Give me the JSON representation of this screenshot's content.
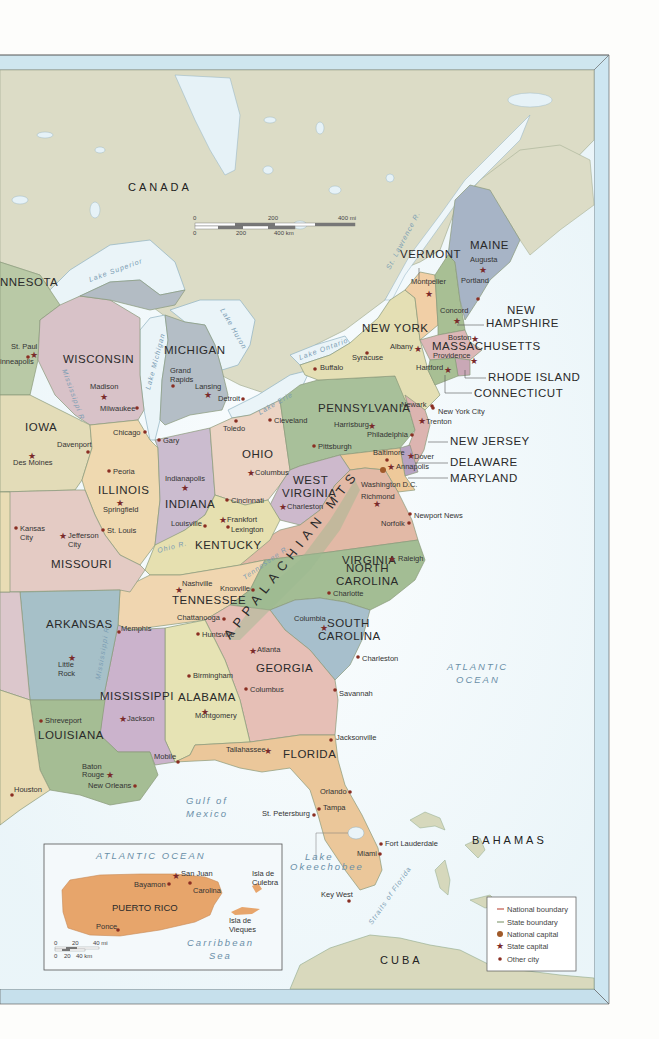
{
  "map": {
    "title": "Eastern United States",
    "colors": {
      "ocean": "#e8f4f8",
      "canada_land": "#dcdcc8",
      "frame_blue": "#cfe6ef",
      "national_boundary": "#c0584a",
      "state_boundary": "#8aa07a",
      "state_capital": "#7a2a2a",
      "other_city": "#8a2e22",
      "national_capital": "#a05a2a"
    },
    "countries": [
      {
        "name": "CANADA",
        "x": 128,
        "y": 191
      },
      {
        "name": "BAHAMAS",
        "x": 472,
        "y": 844
      },
      {
        "name": "CUBA",
        "x": 380,
        "y": 964
      }
    ],
    "water_labels": [
      {
        "name": "ATLANTIC",
        "x": 447,
        "y": 670
      },
      {
        "name": "OCEAN",
        "x": 456,
        "y": 683
      },
      {
        "name": "Gulf of",
        "x": 186,
        "y": 804
      },
      {
        "name": "Mexico",
        "x": 186,
        "y": 817
      },
      {
        "name": "Lake",
        "x": 305,
        "y": 860
      },
      {
        "name": "Okeechobee",
        "x": 290,
        "y": 870
      }
    ],
    "lake_labels": [
      {
        "name": "Lake Superior",
        "x": 90,
        "y": 282,
        "rot": -20
      },
      {
        "name": "Lake Michigan",
        "x": 150,
        "y": 390,
        "rot": -75
      },
      {
        "name": "Lake Huron",
        "x": 220,
        "y": 310,
        "rot": 60
      },
      {
        "name": "Lake Ontario",
        "x": 300,
        "y": 360,
        "rot": -20
      },
      {
        "name": "Lake Erie",
        "x": 260,
        "y": 415,
        "rot": -30
      }
    ],
    "river_labels": [
      {
        "name": "St. Lawrence R.",
        "x": 390,
        "y": 270,
        "rot": -62
      },
      {
        "name": "Mississippi R.",
        "x": 62,
        "y": 370,
        "rot": 70
      },
      {
        "name": "Mississippi R.",
        "x": 100,
        "y": 680,
        "rot": -80
      },
      {
        "name": "Ohio R.",
        "x": 158,
        "y": 553,
        "rot": -15
      },
      {
        "name": "Tennessee R.",
        "x": 245,
        "y": 580,
        "rot": -35
      },
      {
        "name": "Straits of Florida",
        "x": 372,
        "y": 925,
        "rot": -55
      }
    ],
    "mountains": {
      "name": "APPALACHIAN MTS",
      "x": 230,
      "y": 640,
      "rot": -52
    },
    "states": [
      {
        "name": "NNESOTA",
        "x": 0,
        "y": 286
      },
      {
        "name": "WISCONSIN",
        "x": 63,
        "y": 363
      },
      {
        "name": "MICHIGAN",
        "x": 164,
        "y": 354
      },
      {
        "name": "IOWA",
        "x": 25,
        "y": 431
      },
      {
        "name": "ILLINOIS",
        "x": 98,
        "y": 494
      },
      {
        "name": "INDIANA",
        "x": 165,
        "y": 508
      },
      {
        "name": "OHIO",
        "x": 242,
        "y": 458
      },
      {
        "name": "PENNSYLVANIA",
        "x": 318,
        "y": 412
      },
      {
        "name": "NEW YORK",
        "x": 362,
        "y": 332
      },
      {
        "name": "VERMONT",
        "x": 400,
        "y": 258
      },
      {
        "name": "MAINE",
        "x": 470,
        "y": 249
      },
      {
        "name": "MASSACHUSETTS",
        "x": 432,
        "y": 350
      },
      {
        "name": "WEST",
        "x": 293,
        "y": 484
      },
      {
        "name": "VIRGINIA",
        "x": 282,
        "y": 497
      },
      {
        "name": "KENTUCKY",
        "x": 195,
        "y": 549
      },
      {
        "name": "MISSOURI",
        "x": 51,
        "y": 568
      },
      {
        "name": "VIRGINIA",
        "x": 342,
        "y": 564
      },
      {
        "name": "NORTH",
        "x": 346,
        "y": 572
      },
      {
        "name": "CAROLINA",
        "x": 336,
        "y": 585
      },
      {
        "name": "TENNESSEE",
        "x": 172,
        "y": 604
      },
      {
        "name": "ARKANSAS",
        "x": 46,
        "y": 628
      },
      {
        "name": "SOUTH",
        "x": 327,
        "y": 627
      },
      {
        "name": "CAROLINA",
        "x": 318,
        "y": 640
      },
      {
        "name": "GEORGIA",
        "x": 256,
        "y": 672
      },
      {
        "name": "MISSISSIPPI",
        "x": 100,
        "y": 700
      },
      {
        "name": "ALABAMA",
        "x": 178,
        "y": 701
      },
      {
        "name": "LOUISIANA",
        "x": 38,
        "y": 739
      },
      {
        "name": "FLORIDA",
        "x": 283,
        "y": 758
      },
      {
        "name": "PUERTO RICO",
        "x": 112,
        "y": 911
      }
    ],
    "callout_states": [
      {
        "name": "NEW",
        "x": 507,
        "y": 314
      },
      {
        "name": "HAMPSHIRE",
        "x": 486,
        "y": 327
      },
      {
        "name": "RHODE ISLAND",
        "x": 488,
        "y": 381
      },
      {
        "name": "CONNECTICUT",
        "x": 474,
        "y": 397
      },
      {
        "name": "NEW JERSEY",
        "x": 450,
        "y": 445
      },
      {
        "name": "DELAWARE",
        "x": 450,
        "y": 466
      },
      {
        "name": "MARYLAND",
        "x": 450,
        "y": 482
      }
    ],
    "cities": [
      {
        "name": "Augusta",
        "x": 470,
        "y": 262,
        "type": "state_capital",
        "mx": 483,
        "my": 269
      },
      {
        "name": "Portland",
        "x": 461,
        "y": 283,
        "type": "city",
        "mx": 478,
        "my": 299,
        "lx": 461,
        "ly": 285
      },
      {
        "name": "Montpelier",
        "x": 411,
        "y": 284,
        "type": "state_capital",
        "mx": 429,
        "my": 293
      },
      {
        "name": "Concord",
        "x": 440,
        "y": 313,
        "type": "state_capital",
        "mx": 457,
        "my": 320
      },
      {
        "name": "Boston",
        "x": 448,
        "y": 340,
        "type": "state_capital",
        "mx": 475,
        "my": 338
      },
      {
        "name": "Providence",
        "x": 433,
        "y": 358,
        "type": "state_capital",
        "mx": 474,
        "my": 360
      },
      {
        "name": "Hartford",
        "x": 416,
        "y": 370,
        "type": "state_capital",
        "mx": 448,
        "my": 369
      },
      {
        "name": "Albany",
        "x": 390,
        "y": 349,
        "type": "state_capital",
        "mx": 418,
        "my": 348
      },
      {
        "name": "Syracuse",
        "x": 352,
        "y": 360,
        "type": "city",
        "mx": 367,
        "my": 353
      },
      {
        "name": "Buffalo",
        "x": 320,
        "y": 370,
        "type": "city",
        "mx": 315,
        "my": 369
      },
      {
        "name": "Newark",
        "x": 401,
        "y": 407,
        "type": "city",
        "mx": 432,
        "my": 406
      },
      {
        "name": "New York City",
        "x": 438,
        "y": 414,
        "type": "city",
        "mx": 433,
        "my": 408
      },
      {
        "name": "Trenton",
        "x": 426,
        "y": 424,
        "type": "state_capital",
        "mx": 422,
        "my": 420
      },
      {
        "name": "Harrisburg",
        "x": 334,
        "y": 427,
        "type": "state_capital",
        "mx": 372,
        "my": 425
      },
      {
        "name": "Philadelphia",
        "x": 367,
        "y": 437,
        "type": "city",
        "mx": 412,
        "my": 435
      },
      {
        "name": "Pittsburgh",
        "x": 318,
        "y": 449,
        "type": "city",
        "mx": 314,
        "my": 446
      },
      {
        "name": "Baltimore",
        "x": 373,
        "y": 455,
        "type": "city",
        "mx": 387,
        "my": 460
      },
      {
        "name": "Dover",
        "x": 414,
        "y": 459,
        "type": "state_capital",
        "mx": 411,
        "my": 455
      },
      {
        "name": "Annapolis",
        "x": 396,
        "y": 469,
        "type": "state_capital",
        "mx": 391,
        "my": 466
      },
      {
        "name": "Washington D.C.",
        "x": 361,
        "y": 487,
        "type": "national_capital",
        "mx": 383,
        "my": 470
      },
      {
        "name": "Richmond",
        "x": 361,
        "y": 499,
        "type": "state_capital",
        "mx": 377,
        "my": 503
      },
      {
        "name": "Newport News",
        "x": 414,
        "y": 518,
        "type": "city",
        "mx": 410,
        "my": 514
      },
      {
        "name": "Norfolk",
        "x": 381,
        "y": 526,
        "type": "city",
        "mx": 409,
        "my": 523
      },
      {
        "name": "Raleigh",
        "x": 398,
        "y": 561,
        "type": "state_capital",
        "mx": 392,
        "my": 558
      },
      {
        "name": "Charlotte",
        "x": 333,
        "y": 596,
        "type": "city",
        "mx": 329,
        "my": 593
      },
      {
        "name": "Columbia",
        "x": 294,
        "y": 621,
        "type": "state_capital",
        "mx": 324,
        "my": 627
      },
      {
        "name": "Charleston",
        "x": 362,
        "y": 661,
        "type": "city",
        "mx": 358,
        "my": 657
      },
      {
        "name": "Savannah",
        "x": 339,
        "y": 696,
        "type": "city",
        "mx": 335,
        "my": 690
      },
      {
        "name": "Cleveland",
        "x": 274,
        "y": 423,
        "type": "city",
        "mx": 270,
        "my": 420
      },
      {
        "name": "Toledo",
        "x": 223,
        "y": 431,
        "type": "city",
        "mx": 236,
        "my": 421
      },
      {
        "name": "Detroit",
        "x": 218,
        "y": 401,
        "type": "city",
        "mx": 243,
        "my": 399
      },
      {
        "name": "Lansing",
        "x": 195,
        "y": 389,
        "type": "state_capital",
        "mx": 208,
        "my": 394
      },
      {
        "name": "Grand",
        "x": 170,
        "y": 373,
        "type": "none"
      },
      {
        "name": "Rapids",
        "x": 170,
        "y": 382,
        "type": "city",
        "mx": 173,
        "my": 386
      },
      {
        "name": "Columbus",
        "x": 255,
        "y": 475,
        "type": "state_capital",
        "mx": 251,
        "my": 472
      },
      {
        "name": "Cincinnati",
        "x": 231,
        "y": 503,
        "type": "city",
        "mx": 227,
        "my": 500
      },
      {
        "name": "Charleston",
        "x": 287,
        "y": 509,
        "type": "state_capital",
        "mx": 283,
        "my": 506
      },
      {
        "name": "Frankfort",
        "x": 227,
        "y": 522,
        "type": "state_capital",
        "mx": 223,
        "my": 519
      },
      {
        "name": "Lexington",
        "x": 231,
        "y": 532,
        "type": "city",
        "mx": 228,
        "my": 527
      },
      {
        "name": "Louisville",
        "x": 171,
        "y": 526,
        "type": "city",
        "mx": 205,
        "my": 526
      },
      {
        "name": "Indianapolis",
        "x": 165,
        "y": 481,
        "type": "none"
      },
      {
        "name": "",
        "x": 0,
        "y": 0,
        "type": "state_capital",
        "mx": 185,
        "my": 487
      },
      {
        "name": "Gary",
        "x": 163,
        "y": 443,
        "type": "city",
        "mx": 159,
        "my": 440
      },
      {
        "name": "Chicago",
        "x": 113,
        "y": 435,
        "type": "city",
        "mx": 145,
        "my": 432
      },
      {
        "name": "Peoria",
        "x": 113,
        "y": 474,
        "type": "city",
        "mx": 109,
        "my": 471
      },
      {
        "name": "Springfield",
        "x": 103,
        "y": 512,
        "type": "state_capital",
        "mx": 120,
        "my": 502
      },
      {
        "name": "St. Louis",
        "x": 107,
        "y": 533,
        "type": "city",
        "mx": 103,
        "my": 530
      },
      {
        "name": "Milwaukee",
        "x": 100,
        "y": 411,
        "type": "city",
        "mx": 137,
        "my": 408
      },
      {
        "name": "Madison",
        "x": 90,
        "y": 389,
        "type": "none"
      },
      {
        "name": "",
        "x": 0,
        "y": 0,
        "type": "state_capital",
        "mx": 104,
        "my": 396
      },
      {
        "name": "St. Paul",
        "x": 11,
        "y": 349,
        "type": "none"
      },
      {
        "name": "",
        "x": 0,
        "y": 0,
        "type": "state_capital",
        "mx": 34,
        "my": 354
      },
      {
        "name": "inneapolis",
        "x": 0,
        "y": 364,
        "type": "city",
        "mx": 28,
        "my": 357
      },
      {
        "name": "Davenport",
        "x": 57,
        "y": 447,
        "type": "city",
        "mx": 88,
        "my": 452
      },
      {
        "name": "Des Moines",
        "x": 13,
        "y": 465,
        "type": "none"
      },
      {
        "name": "",
        "x": 0,
        "y": 0,
        "type": "state_capital",
        "mx": 32,
        "my": 455
      },
      {
        "name": "Kansas",
        "x": 20,
        "y": 531,
        "type": "city",
        "mx": 16,
        "my": 528
      },
      {
        "name": "City",
        "x": 20,
        "y": 540,
        "type": "none"
      },
      {
        "name": "Jefferson",
        "x": 68,
        "y": 538,
        "type": "state_capital",
        "mx": 63,
        "my": 535
      },
      {
        "name": "City",
        "x": 68,
        "y": 547,
        "type": "none"
      },
      {
        "name": "Nashville",
        "x": 182,
        "y": 586,
        "type": "state_capital",
        "mx": 179,
        "my": 589
      },
      {
        "name": "Knoxville",
        "x": 220,
        "y": 591,
        "type": "city",
        "mx": 253,
        "my": 590
      },
      {
        "name": "Chattanooga",
        "x": 177,
        "y": 620,
        "type": "city",
        "mx": 224,
        "my": 619
      },
      {
        "name": "Memphis",
        "x": 121,
        "y": 631,
        "type": "city",
        "mx": 119,
        "my": 632
      },
      {
        "name": "Huntsville",
        "x": 202,
        "y": 637,
        "type": "city",
        "mx": 198,
        "my": 634
      },
      {
        "name": "Atlanta",
        "x": 257,
        "y": 652,
        "type": "state_capital",
        "mx": 253,
        "my": 650
      },
      {
        "name": "Birmingham",
        "x": 193,
        "y": 678,
        "type": "city",
        "mx": 189,
        "my": 676
      },
      {
        "name": "Columbus",
        "x": 250,
        "y": 692,
        "type": "city",
        "mx": 246,
        "my": 689
      },
      {
        "name": "Montgomery",
        "x": 195,
        "y": 718,
        "type": "state_capital",
        "mx": 205,
        "my": 711
      },
      {
        "name": "Jackson",
        "x": 127,
        "y": 721,
        "type": "state_capital",
        "mx": 123,
        "my": 718
      },
      {
        "name": "Little",
        "x": 58,
        "y": 667,
        "type": "state_capital",
        "mx": 72,
        "my": 657
      },
      {
        "name": "Rock",
        "x": 58,
        "y": 676,
        "type": "none"
      },
      {
        "name": "Shreveport",
        "x": 45,
        "y": 723,
        "type": "city",
        "mx": 41,
        "my": 721
      },
      {
        "name": "Baton",
        "x": 82,
        "y": 769,
        "type": "none"
      },
      {
        "name": "Rouge",
        "x": 82,
        "y": 777,
        "type": "state_capital",
        "mx": 110,
        "my": 774
      },
      {
        "name": "New Orleans",
        "x": 88,
        "y": 788,
        "type": "city",
        "mx": 135,
        "my": 786
      },
      {
        "name": "Houston",
        "x": 14,
        "y": 792,
        "type": "city",
        "mx": 12,
        "my": 795
      },
      {
        "name": "Mobile",
        "x": 154,
        "y": 759,
        "type": "city",
        "mx": 178,
        "my": 762
      },
      {
        "name": "Tallahassee",
        "x": 226,
        "y": 752,
        "type": "state_capital",
        "mx": 268,
        "my": 750
      },
      {
        "name": "Jacksonville",
        "x": 336,
        "y": 740,
        "type": "city",
        "mx": 331,
        "my": 740
      },
      {
        "name": "Orlando",
        "x": 320,
        "y": 794,
        "type": "city",
        "mx": 350,
        "my": 792
      },
      {
        "name": "Tampa",
        "x": 323,
        "y": 810,
        "type": "city",
        "mx": 319,
        "my": 809
      },
      {
        "name": "St. Petersburg",
        "x": 262,
        "y": 816,
        "type": "city",
        "mx": 314,
        "my": 815
      },
      {
        "name": "Fort Lauderdale",
        "x": 385,
        "y": 846,
        "type": "city",
        "mx": 381,
        "my": 844
      },
      {
        "name": "Miami",
        "x": 357,
        "y": 856,
        "type": "city",
        "mx": 380,
        "my": 854
      },
      {
        "name": "Key West",
        "x": 321,
        "y": 897,
        "type": "city",
        "mx": 349,
        "my": 901
      }
    ],
    "inset": {
      "title": "ATLANTIC OCEAN",
      "island": "PUERTO RICO",
      "sea_line1": "Carribbean",
      "sea_line2": "Sea",
      "cities": [
        {
          "name": "San Juan",
          "type": "state_capital"
        },
        {
          "name": "Bayamon",
          "type": "city"
        },
        {
          "name": "Carolina",
          "type": "city"
        },
        {
          "name": "Ponce",
          "type": "city"
        }
      ],
      "islands": [
        "Isla de",
        "Culebra",
        "Isla de",
        "Vieques"
      ],
      "scale": {
        "top": [
          "0",
          "20",
          "40 mi"
        ],
        "bottom": [
          "0",
          "20",
          "40 km"
        ]
      }
    },
    "scale_bar": {
      "top": [
        "0",
        "200",
        "400 mi"
      ],
      "bottom": [
        "0",
        "200",
        "400 km"
      ]
    },
    "legend": {
      "items": [
        {
          "label": "National boundary",
          "symbol": "line-red"
        },
        {
          "label": "State boundary",
          "symbol": "line-green"
        },
        {
          "label": "National capital",
          "symbol": "national-capital"
        },
        {
          "label": "State capital",
          "symbol": "star"
        },
        {
          "label": "Other city",
          "symbol": "dot"
        }
      ]
    }
  }
}
